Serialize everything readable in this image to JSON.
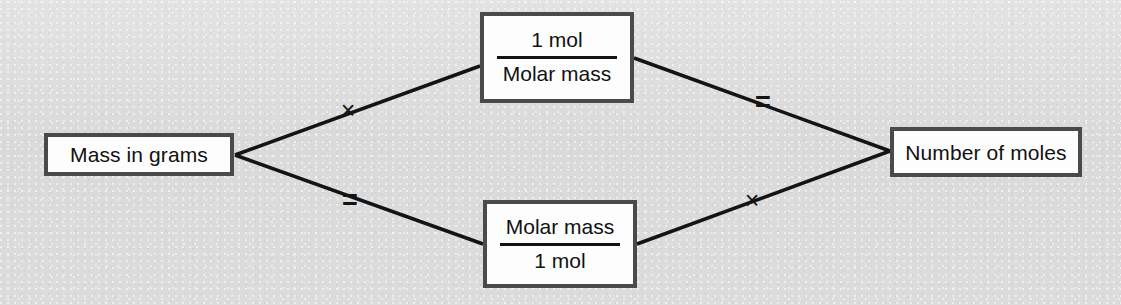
{
  "diagram": {
    "background_color": "#dcdcdc",
    "box_fill_color": "#fdfdfd",
    "box_border_color": "#4a4a4a",
    "line_color": "#141414",
    "nodes": {
      "mass_in_grams": {
        "label": "Mass in grams"
      },
      "number_of_moles": {
        "label": "Number of moles"
      },
      "fraction_top": {
        "numerator": "1 mol",
        "denominator": "Molar mass"
      },
      "fraction_bottom": {
        "numerator": "Molar mass",
        "denominator": "1 mol"
      }
    },
    "operators": {
      "multiply_upper_left": "×",
      "equals_lower_left": "=",
      "equals_upper_right": "=",
      "multiply_lower_right": "×"
    }
  }
}
